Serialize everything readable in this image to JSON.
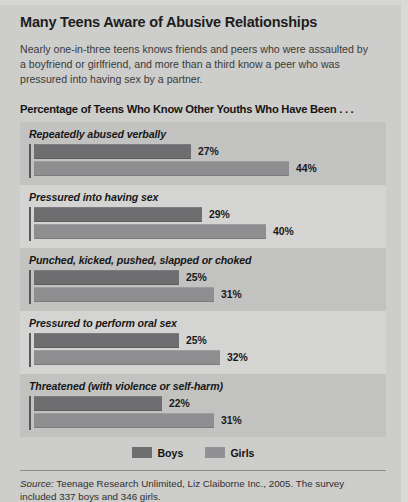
{
  "title": "Many Teens Aware of Abusive Relationships",
  "deck": "Nearly one-in-three teens knows friends and peers who were assaulted by a boyfriend or girlfriend, and more than a third know a peer who was pressured into having sex by a partner.",
  "section_header": "Percentage of Teens Who Know Other Youths Who Have Been . . .",
  "legend": {
    "boys_label": "Boys",
    "girls_label": "Girls",
    "boys_color": "#6e6e70",
    "girls_color": "#919193"
  },
  "source": {
    "prefix": "Source:",
    "text": " Teenage Research Unlimited, Liz Claiborne Inc., 2005. The survey included 337 boys and 346 girls."
  },
  "chart_data": {
    "type": "bar",
    "title": "Percentage of Teens Who Know Other Youths Who Have Been . . .",
    "orientation": "horizontal",
    "grouped": true,
    "xlabel": "",
    "ylabel": "",
    "xlim": [
      0,
      50
    ],
    "grid": false,
    "legend_position": "bottom-center",
    "value_suffix": "%",
    "categories": [
      "Repeatedly abused verbally",
      "Pressured into having sex",
      "Punched, kicked, pushed, slapped or choked",
      "Pressured to perform oral sex",
      "Threatened (with violence or self-harm)"
    ],
    "series": [
      {
        "name": "Boys",
        "color": "#6e6e70",
        "values": [
          27,
          29,
          25,
          25,
          22
        ]
      },
      {
        "name": "Girls",
        "color": "#8e8e90",
        "values": [
          44,
          40,
          31,
          32,
          31
        ]
      }
    ],
    "labels": {
      "boys": [
        "27%",
        "29%",
        "25%",
        "25%",
        "22%"
      ],
      "girls": [
        "44%",
        "40%",
        "31%",
        "32%",
        "31%"
      ]
    }
  }
}
